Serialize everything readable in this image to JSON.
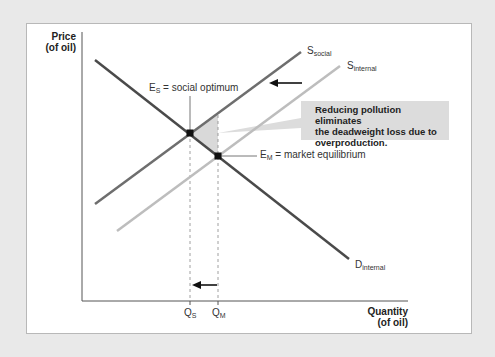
{
  "figure": {
    "y_axis_title_line1": "Price",
    "y_axis_title_line2": "(of oil)",
    "x_axis_title_line1": "Quantity",
    "x_axis_title_line2": "(of oil)",
    "curves": {
      "s_social": {
        "base": "S",
        "sub": "social",
        "color": "#6e6e6e"
      },
      "s_internal": {
        "base": "S",
        "sub": "internal",
        "color": "#bdbdbd"
      },
      "d_internal": {
        "base": "D",
        "sub": "internal",
        "color": "#4a4a4a"
      }
    },
    "points": {
      "es": {
        "base": "E",
        "sub": "S",
        "text": " = social optimum"
      },
      "em": {
        "base": "E",
        "sub": "M",
        "text": " = market equilibrium"
      }
    },
    "ticks": {
      "qs": {
        "base": "Q",
        "sub": "S"
      },
      "qm": {
        "base": "Q",
        "sub": "M"
      }
    },
    "callout": {
      "line1": "Reducing pollution eliminates",
      "line2": "the deadweight loss due to",
      "line3": "overproduction."
    },
    "colors": {
      "background": "#e9e9e9",
      "panel": "#ffffff",
      "deadweight_area": "#d9d9d9",
      "callout_bg": "#dcdcdc"
    }
  }
}
